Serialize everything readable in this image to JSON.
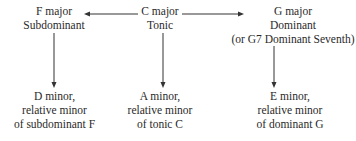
{
  "nodes": {
    "f_major": {
      "title": "F major",
      "role": "Subdominant"
    },
    "c_major": {
      "title": "C major",
      "role": "Tonic"
    },
    "g_major": {
      "title": "G major",
      "role": "Dominant",
      "note": "(or G7 Dominant Seventh)"
    },
    "d_minor": {
      "title": "D minor,",
      "line2": "relative minor",
      "line3_prefix": "of subdominant ",
      "line3_key": "F"
    },
    "a_minor": {
      "title": "A minor,",
      "line2": "relative minor",
      "line3_prefix": "of tonic ",
      "line3_key": "C"
    },
    "e_minor": {
      "title": "E minor,",
      "line2": "relative minor",
      "line3_prefix": "of dominant ",
      "line3_key": "G"
    }
  },
  "edges": [
    {
      "from": "c_major",
      "to": "f_major"
    },
    {
      "from": "c_major",
      "to": "g_major"
    },
    {
      "from": "f_major",
      "to": "d_minor"
    },
    {
      "from": "c_major",
      "to": "a_minor"
    },
    {
      "from": "g_major",
      "to": "e_minor"
    }
  ]
}
